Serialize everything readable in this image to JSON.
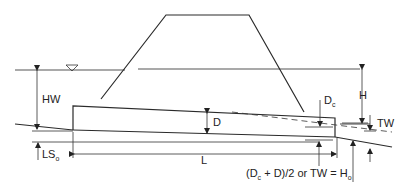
{
  "diagram": {
    "labels": {
      "hw": "HW",
      "h": "H",
      "d": "D",
      "dc": "D",
      "dc_sub": "c",
      "tw": "TW",
      "l": "L",
      "ls": "LS",
      "ls_sub": "o",
      "ho_formula_a": "(D",
      "ho_formula_a_sub": "c",
      "ho_formula_b": " + D)/2 or TW = H",
      "ho_formula_b_sub": "o"
    },
    "symbols": {
      "water_surface": "inverted-triangle-icon"
    }
  }
}
